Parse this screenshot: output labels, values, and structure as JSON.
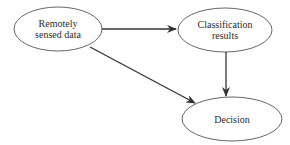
{
  "diagram": {
    "type": "flowchart",
    "nodes": [
      {
        "id": "remote",
        "label": "Remotely\nsensed data",
        "cx": 58,
        "cy": 29,
        "rx": 44,
        "ry": 22
      },
      {
        "id": "classification",
        "label": "Classification\nresults",
        "cx": 225,
        "cy": 30,
        "rx": 47,
        "ry": 22
      },
      {
        "id": "decision",
        "label": "Decision",
        "cx": 232,
        "cy": 119,
        "rx": 50,
        "ry": 22
      }
    ],
    "edges": [
      {
        "from": "remote",
        "to": "classification"
      },
      {
        "from": "remote",
        "to": "decision"
      },
      {
        "from": "classification",
        "to": "decision"
      }
    ],
    "colors": {
      "stroke": "#333333",
      "ellipse_stroke": "#555555",
      "text": "#2a2a2a",
      "background": "#ffffff"
    }
  }
}
